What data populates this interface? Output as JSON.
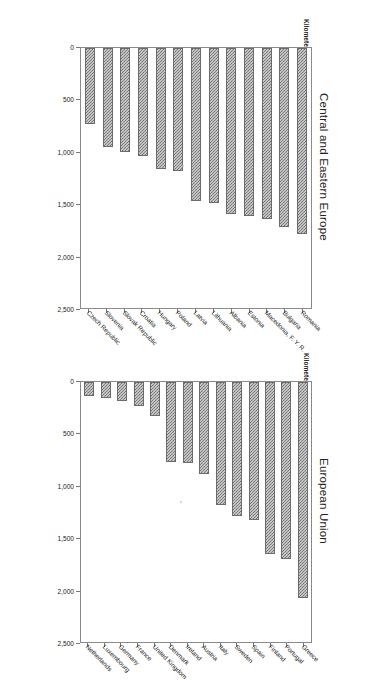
{
  "figure": {
    "axis_unit_label": "Kilometers",
    "tick_labels": [
      "2,500",
      "2,000",
      "1,500",
      "1,000",
      "500",
      "0"
    ],
    "bar_color": "#8c8c8c",
    "bar_edge_color": "#6b6b6b"
  },
  "chart_data": [
    {
      "type": "bar",
      "orientation": "horizontal",
      "title": "Central and Eastern Europe",
      "xlabel": "Kilometers",
      "ylabel": "",
      "xlim": [
        0,
        2500
      ],
      "grid": false,
      "legend": "none",
      "xticks": [
        0,
        500,
        1000,
        1500,
        2000,
        2500
      ],
      "xticklabels": [
        "0",
        "500",
        "1,000",
        "1,500",
        "2,000",
        "2,500"
      ],
      "categories": [
        "Romania",
        "Bulgaria",
        "Macedonia, F. Y. R.",
        "Estonia",
        "Albania",
        "Lithuania",
        "Latvia",
        "Poland",
        "Hungary",
        "Croatia",
        "Slovak Republic",
        "Slovenia",
        "Czech Republic"
      ],
      "values": [
        1790,
        1720,
        1640,
        1620,
        1600,
        1490,
        1470,
        1180,
        1160,
        1040,
        1000,
        950,
        730
      ]
    },
    {
      "type": "bar",
      "orientation": "horizontal",
      "title": "European Union",
      "xlabel": "Kilometers",
      "ylabel": "",
      "xlim": [
        0,
        2500
      ],
      "grid": false,
      "legend": "none",
      "xticks": [
        0,
        500,
        1000,
        1500,
        2000,
        2500
      ],
      "xticklabels": [
        "0",
        "500",
        "1,000",
        "1,500",
        "2,000",
        "2,500"
      ],
      "categories": [
        "Greece",
        "Portugal",
        "Finland",
        "Spain",
        "Sweden",
        "Italy",
        "Austria",
        "Ireland",
        "Denmark",
        "United Kingdom",
        "France",
        "Germany",
        "Luxembourg",
        "Netherlands"
      ],
      "values": [
        2080,
        1700,
        1655,
        1325,
        1290,
        1185,
        885,
        780,
        770,
        330,
        230,
        180,
        155,
        135
      ]
    }
  ]
}
